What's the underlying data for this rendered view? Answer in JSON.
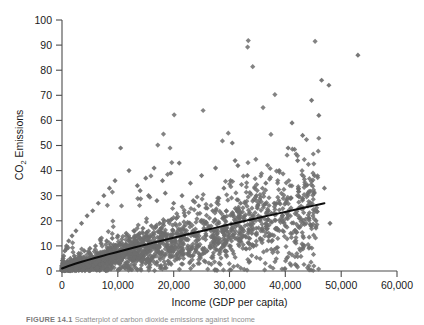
{
  "figure": {
    "caption_label": "FIGURE 14.1",
    "caption_text": "Scatterplot of carbon dioxide emissions against income"
  },
  "chart_data": {
    "type": "scatter",
    "title": "",
    "xlabel": "Income (GDP per capita)",
    "ylabel": "CO2 Emissions",
    "ylabel_base": "CO",
    "ylabel_sub": "2",
    "ylabel_rest": " Emissions",
    "xlim": [
      0,
      60000
    ],
    "ylim": [
      0,
      100
    ],
    "xticks": [
      0,
      10000,
      20000,
      30000,
      40000,
      50000,
      60000
    ],
    "xtick_labels": [
      "0",
      "10,000",
      "20,000",
      "30,000",
      "40,000",
      "50,000",
      "60,000"
    ],
    "yticks": [
      0,
      10,
      20,
      30,
      40,
      50,
      60,
      70,
      80,
      90,
      100
    ],
    "ytick_labels": [
      "0",
      "10",
      "20",
      "30",
      "40",
      "50",
      "60",
      "70",
      "80",
      "90",
      "100"
    ],
    "grid": false,
    "legend": false,
    "marker": {
      "shape": "diamond",
      "color": "#6d6d6d",
      "size_px": 2.6
    },
    "series": [
      {
        "name": "Countries",
        "points": [
          [
            53000,
            86
          ],
          [
            46500,
            76
          ],
          [
            47800,
            74
          ],
          [
            44700,
            68
          ],
          [
            46000,
            62
          ],
          [
            41200,
            59
          ],
          [
            43100,
            54
          ],
          [
            40500,
            49
          ],
          [
            42200,
            44
          ],
          [
            38900,
            40
          ],
          [
            45200,
            38
          ],
          [
            47000,
            33
          ],
          [
            44000,
            31
          ],
          [
            41000,
            29
          ],
          [
            38000,
            27
          ],
          [
            36500,
            35
          ],
          [
            34800,
            30
          ],
          [
            33200,
            38
          ],
          [
            31500,
            42
          ],
          [
            30200,
            36
          ],
          [
            29000,
            33
          ],
          [
            28100,
            29
          ],
          [
            32000,
            27
          ],
          [
            35000,
            25
          ],
          [
            37500,
            23
          ],
          [
            39500,
            22
          ],
          [
            42500,
            21
          ],
          [
            45500,
            20
          ],
          [
            48000,
            19
          ],
          [
            30500,
            51
          ],
          [
            31000,
            44
          ],
          [
            27500,
            41
          ],
          [
            25000,
            38
          ],
          [
            23000,
            35
          ],
          [
            21000,
            43
          ],
          [
            19500,
            39
          ],
          [
            18000,
            36
          ],
          [
            16500,
            41
          ],
          [
            15000,
            37
          ],
          [
            13500,
            34
          ],
          [
            12000,
            40
          ],
          [
            10500,
            49
          ],
          [
            9500,
            36
          ],
          [
            8500,
            33
          ],
          [
            7500,
            30
          ],
          [
            6500,
            27
          ],
          [
            5500,
            24
          ],
          [
            4500,
            22
          ],
          [
            3500,
            19
          ],
          [
            2500,
            16
          ],
          [
            1800,
            14
          ],
          [
            1200,
            12
          ],
          [
            800,
            10
          ],
          [
            500,
            8
          ],
          [
            300,
            6
          ],
          [
            200,
            5
          ],
          [
            150,
            4
          ],
          [
            100,
            3
          ],
          [
            60,
            2
          ],
          [
            14000,
            32
          ],
          [
            15500,
            30
          ],
          [
            17000,
            28
          ],
          [
            18500,
            31
          ],
          [
            20000,
            27
          ],
          [
            21500,
            30
          ],
          [
            23500,
            28
          ],
          [
            24500,
            26
          ],
          [
            26000,
            25
          ],
          [
            27000,
            24
          ],
          [
            22000,
            22
          ],
          [
            20500,
            21
          ],
          [
            19000,
            20
          ],
          [
            17500,
            19
          ],
          [
            16000,
            18
          ],
          [
            14500,
            17
          ],
          [
            13000,
            16
          ],
          [
            11500,
            15
          ],
          [
            10000,
            14
          ],
          [
            9000,
            13
          ],
          [
            8000,
            12
          ],
          [
            7000,
            11
          ],
          [
            6000,
            10
          ],
          [
            5000,
            9
          ],
          [
            4000,
            8
          ],
          [
            3000,
            7
          ],
          [
            2200,
            6
          ],
          [
            1500,
            5
          ],
          [
            1000,
            4
          ],
          [
            700,
            3
          ],
          [
            400,
            2
          ],
          [
            250,
            1.5
          ],
          [
            120,
            1
          ],
          [
            40000,
            18
          ],
          [
            38500,
            17
          ],
          [
            36000,
            16
          ],
          [
            34000,
            15
          ],
          [
            32500,
            14
          ],
          [
            31000,
            13
          ],
          [
            29500,
            12
          ],
          [
            28000,
            11
          ],
          [
            26500,
            10
          ],
          [
            25500,
            9
          ],
          [
            24000,
            8
          ],
          [
            22500,
            7
          ],
          [
            35500,
            13
          ],
          [
            37000,
            12
          ],
          [
            33500,
            11
          ],
          [
            30000,
            10
          ],
          [
            28500,
            9
          ],
          [
            26000,
            8
          ],
          [
            24500,
            7
          ],
          [
            23000,
            6
          ],
          [
            21000,
            5
          ],
          [
            19000,
            4
          ],
          [
            17000,
            3.5
          ],
          [
            15000,
            3
          ],
          [
            13000,
            2.5
          ],
          [
            11000,
            2
          ],
          [
            9000,
            1.8
          ],
          [
            7000,
            1.5
          ],
          [
            5000,
            1.2
          ],
          [
            3000,
            1
          ],
          [
            1500,
            0.8
          ],
          [
            500,
            0.5
          ]
        ]
      }
    ],
    "trendline": {
      "name": "Fitted curve",
      "color": "#0d0d0d",
      "x_start": 0,
      "x_end": 47000,
      "y_start": 1,
      "y_end": 27
    },
    "n_points_approx": 2000
  }
}
